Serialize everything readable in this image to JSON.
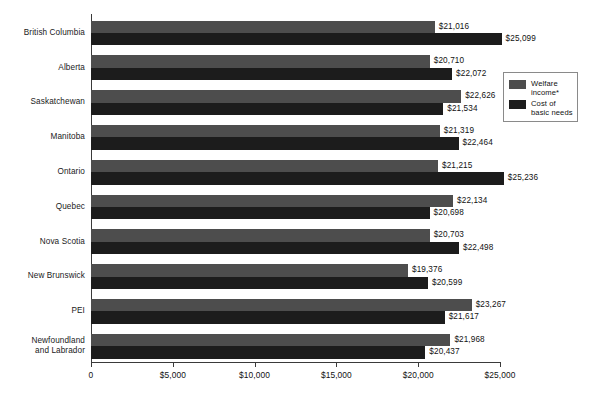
{
  "chart_data": {
    "type": "bar",
    "orientation": "horizontal",
    "title": "",
    "subtitle": "",
    "xlabel": "",
    "ylabel": "",
    "xlim": [
      0,
      25000
    ],
    "xticks": [
      0,
      5000,
      10000,
      15000,
      20000,
      25000
    ],
    "xtick_labels": [
      "0",
      "$5,000",
      "$10,000",
      "$15,000",
      "$20,000",
      "$25,000"
    ],
    "grid": false,
    "legend_position": "upper-right-inside",
    "categories": [
      "British Columbia",
      "Alberta",
      "Saskatchewan",
      "Manitoba",
      "Ontario",
      "Quebec",
      "Nova Scotia",
      "New Brunswick",
      "PEI",
      "Newfoundland and Labrador"
    ],
    "series": [
      {
        "name": "Welfare income*",
        "color": "#4d4d4d",
        "values": [
          21016,
          20710,
          22626,
          21319,
          21215,
          22134,
          20703,
          19376,
          23267,
          21968
        ],
        "value_labels": [
          "$21,016",
          "$20,710",
          "$22,626",
          "$21,319",
          "$21,215",
          "$22,134",
          "$20,703",
          "$19,376",
          "$23,267",
          "$21,968"
        ]
      },
      {
        "name": "Cost of basic needs",
        "color": "#1c1c1c",
        "values": [
          25099,
          22072,
          21534,
          22464,
          25236,
          20698,
          22498,
          20599,
          21617,
          20437
        ],
        "value_labels": [
          "$25,099",
          "$22,072",
          "$21,534",
          "$22,464",
          "$25,236",
          "$20,698",
          "$22,498",
          "$20,599",
          "$21,617",
          "$20,437"
        ]
      }
    ],
    "legend": [
      "Welfare\nincome*",
      "Cost of\nbasic needs"
    ]
  }
}
